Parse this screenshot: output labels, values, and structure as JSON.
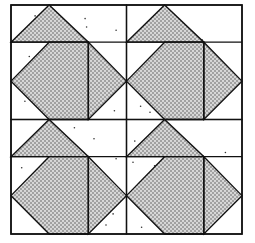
{
  "pattern": {
    "rows": 2,
    "cols": 2,
    "block_name": "repeated quilt block",
    "colors": {
      "background": "#ffffff",
      "line": "#111111",
      "stipple_fill": "#222222",
      "light_dot": "#333333"
    },
    "patches": [
      {
        "name": "top-triangle",
        "fill": "stippled"
      },
      {
        "name": "diamond-left",
        "fill": "stippled"
      },
      {
        "name": "right-triangle",
        "fill": "stippled"
      }
    ]
  }
}
